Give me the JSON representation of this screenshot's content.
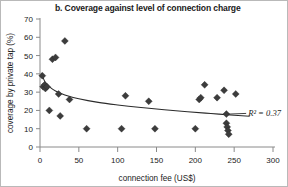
{
  "figure": {
    "title": "b. Coverage against level of connection charge",
    "border_color": "#b9b9b9",
    "background": "#ffffff"
  },
  "chart_data": {
    "type": "scatter",
    "title": "b. Coverage against level of connection charge",
    "xlabel": "connection fee (US$)",
    "ylabel": "coverage by private tap (%)",
    "xlim": [
      0,
      300
    ],
    "ylim": [
      0,
      70
    ],
    "xticks": [
      0,
      50,
      100,
      150,
      200,
      250,
      300
    ],
    "yticks": [
      0,
      10,
      20,
      30,
      40,
      50,
      60,
      70
    ],
    "grid": false,
    "legend": null,
    "marker": {
      "shape": "diamond",
      "color": "#3c3c3c",
      "size": 7
    },
    "annotations": [
      {
        "text": "R² = 0.37",
        "r2_value": 0.37,
        "x": 268,
        "y": 17,
        "leader_from_x": 243,
        "leader_from_y": 18
      }
    ],
    "series": [
      {
        "name": "coverage by private tap",
        "points": [
          [
            3,
            39
          ],
          [
            4,
            33
          ],
          [
            6,
            34
          ],
          [
            7,
            32
          ],
          [
            9,
            33
          ],
          [
            12,
            20
          ],
          [
            16,
            48
          ],
          [
            20,
            49
          ],
          [
            24,
            29
          ],
          [
            26,
            17
          ],
          [
            32,
            58
          ],
          [
            38,
            26
          ],
          [
            60,
            10
          ],
          [
            105,
            10
          ],
          [
            110,
            28
          ],
          [
            140,
            25
          ],
          [
            148,
            10
          ],
          [
            200,
            10
          ],
          [
            205,
            26
          ],
          [
            207,
            27
          ],
          [
            212,
            34
          ],
          [
            228,
            27
          ],
          [
            237,
            31
          ],
          [
            240,
            18
          ],
          [
            240,
            13
          ],
          [
            241,
            11
          ],
          [
            242,
            9
          ],
          [
            243,
            7
          ],
          [
            252,
            29
          ]
        ]
      }
    ],
    "trend": {
      "type": "logarithmic-decay",
      "label": "fitted trend line",
      "r_squared": 0.37,
      "points": [
        [
          2,
          40.5
        ],
        [
          6,
          36.0
        ],
        [
          12,
          33.0
        ],
        [
          20,
          30.6
        ],
        [
          32,
          28.5
        ],
        [
          50,
          26.4
        ],
        [
          75,
          24.4
        ],
        [
          100,
          23.0
        ],
        [
          130,
          21.6
        ],
        [
          160,
          20.4
        ],
        [
          190,
          19.3
        ],
        [
          220,
          18.3
        ],
        [
          250,
          17.4
        ],
        [
          270,
          16.8
        ]
      ]
    }
  }
}
